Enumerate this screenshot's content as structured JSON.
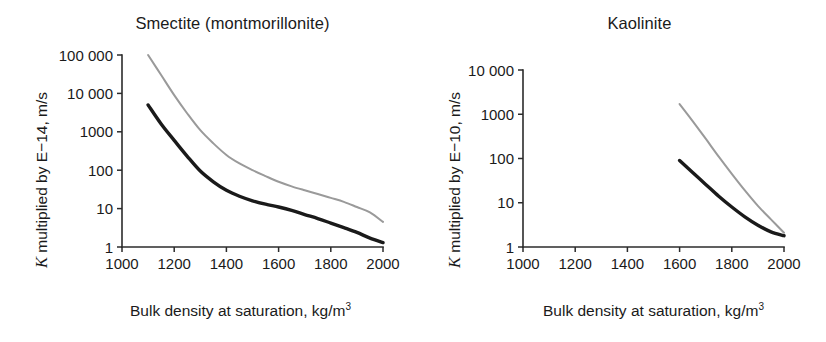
{
  "figure": {
    "background": "#ffffff",
    "panel_count": 2
  },
  "chart_data": [
    {
      "type": "line",
      "id": "smectite",
      "title": "Smectite (montmorillonite)",
      "xlabel": "Bulk density at saturation, kg/m3",
      "xlabel_base": "Bulk density at saturation, kg/m",
      "xlabel_sup": "3",
      "ylabel": "K multiplied by E−14, m/s",
      "ylabel_symbol": "K",
      "ylabel_rest": " multiplied by E−14, m/s",
      "yscale": "log",
      "xlim": [
        1000,
        2000
      ],
      "ylim": [
        1,
        100000
      ],
      "xticks": [
        1000,
        1200,
        1400,
        1600,
        1800,
        2000
      ],
      "xticklabels": [
        "1000",
        "1200",
        "1400",
        "1600",
        "1800",
        "2000"
      ],
      "yticks": [
        1,
        10,
        100,
        1000,
        10000,
        100000
      ],
      "yticklabels": [
        "1",
        "10",
        "100",
        "1000",
        "10 000",
        "100 000"
      ],
      "grid": false,
      "legend": "none",
      "series": [
        {
          "name": "upper-bound",
          "color": "#9a9a9a",
          "width": 2.0,
          "x": [
            1100,
            1150,
            1200,
            1250,
            1300,
            1350,
            1400,
            1450,
            1500,
            1550,
            1600,
            1650,
            1700,
            1750,
            1800,
            1850,
            1900,
            1950,
            2000
          ],
          "y": [
            100000,
            30000,
            9000,
            3000,
            1100,
            500,
            250,
            150,
            100,
            70,
            50,
            38,
            30,
            24,
            19,
            15,
            11,
            8,
            4.5
          ]
        },
        {
          "name": "lower-bound",
          "color": "#1a1a1a",
          "width": 3.4,
          "x": [
            1100,
            1150,
            1200,
            1250,
            1300,
            1350,
            1400,
            1450,
            1500,
            1550,
            1600,
            1650,
            1700,
            1750,
            1800,
            1850,
            1900,
            1950,
            2000
          ],
          "y": [
            5000,
            1600,
            600,
            230,
            95,
            50,
            30,
            21,
            16,
            13,
            11,
            9,
            7,
            5.5,
            4.2,
            3.2,
            2.4,
            1.7,
            1.3
          ]
        }
      ]
    },
    {
      "type": "line",
      "id": "kaolinite",
      "title": "Kaolinite",
      "xlabel": "Bulk density at saturation, kg/m3",
      "xlabel_base": "Bulk density at saturation, kg/m",
      "xlabel_sup": "3",
      "ylabel": "K multiplied by E−10, m/s",
      "ylabel_symbol": "K",
      "ylabel_rest": " multiplied by E−10, m/s",
      "yscale": "log",
      "xlim": [
        1000,
        2000
      ],
      "ylim": [
        1,
        10000
      ],
      "xticks": [
        1000,
        1200,
        1400,
        1600,
        1800,
        2000
      ],
      "xticklabels": [
        "1000",
        "1200",
        "1400",
        "1600",
        "1800",
        "2000"
      ],
      "yticks": [
        1,
        10,
        100,
        1000,
        10000
      ],
      "yticklabels": [
        "1",
        "10",
        "100",
        "1000",
        "10 000"
      ],
      "grid": false,
      "legend": "none",
      "series": [
        {
          "name": "upper-bound",
          "color": "#9a9a9a",
          "width": 2.0,
          "x": [
            1600,
            1650,
            1700,
            1750,
            1800,
            1850,
            1900,
            1950,
            2000
          ],
          "y": [
            1700,
            700,
            280,
            110,
            45,
            19,
            8.5,
            4.2,
            2.1
          ]
        },
        {
          "name": "lower-bound",
          "color": "#1a1a1a",
          "width": 3.4,
          "x": [
            1600,
            1650,
            1700,
            1750,
            1800,
            1850,
            1900,
            1950,
            2000
          ],
          "y": [
            90,
            48,
            26,
            14,
            8.0,
            4.8,
            3.1,
            2.2,
            1.8
          ]
        }
      ]
    }
  ]
}
